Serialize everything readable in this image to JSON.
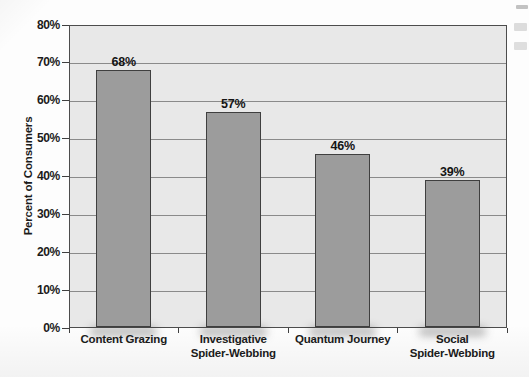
{
  "figure": {
    "y_axis_title": "Percent of Consumers"
  },
  "chart_data": {
    "type": "bar",
    "title": "",
    "xlabel": "",
    "ylabel": "Percent of Consumers",
    "categories": [
      "Content Grazing",
      "Investigative Spider-Webbing",
      "Quantum Journey",
      "Social Spider-Webbing"
    ],
    "category_label_lines": [
      [
        "Content Grazing"
      ],
      [
        "Investigative",
        "Spider-Webbing"
      ],
      [
        "Quantum Journey"
      ],
      [
        "Social",
        "Spider-Webbing"
      ]
    ],
    "values": [
      68,
      57,
      46,
      39
    ],
    "value_labels": [
      "68%",
      "57%",
      "46%",
      "39%"
    ],
    "ylim": [
      0,
      80
    ],
    "yticks": [
      0,
      10,
      20,
      30,
      40,
      50,
      60,
      70,
      80
    ],
    "ytick_labels": [
      "0%",
      "10%",
      "20%",
      "30%",
      "40%",
      "50%",
      "60%",
      "70%",
      "80%"
    ],
    "grid": true,
    "legend": false,
    "colors": {
      "bar_fill": "#9c9c9c",
      "bar_border": "#3f3f3f",
      "plot_background": "#e8e8e8",
      "gridline": "#8a8a8a",
      "plot_border": "#4c4c4c",
      "text": "#1b1b1b",
      "page_background": "#fdfdfd"
    }
  }
}
